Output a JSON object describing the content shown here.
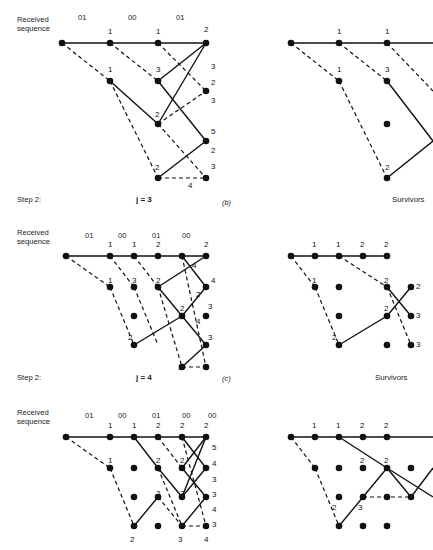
{
  "figure": {
    "caption_parts": [
      "(b)",
      "(c)"
    ],
    "received_label_line1": "Received",
    "received_label_line2": "sequence",
    "step_label": "Step 2:",
    "survivors_label": "Survivors",
    "j_label_b": "j = 3",
    "j_label_c": "j = 4",
    "panel_b_tag": "(b)",
    "panel_c_tag": "(c)",
    "ink_color": "#111111",
    "paper_color": "#ffffff"
  },
  "panels": [
    {
      "id": "panel-b",
      "tag": "(b)",
      "step": "Step 2:",
      "j": "j = 3",
      "received_sequence": [
        "01",
        "00",
        "01"
      ],
      "left_metrics": [
        {
          "value": "1",
          "x": 112,
          "y": 36
        },
        {
          "value": "1",
          "x": 160,
          "y": 36
        },
        {
          "value": "2",
          "x": 206,
          "y": 34
        },
        {
          "value": "1",
          "x": 112,
          "y": 74
        },
        {
          "value": "3",
          "x": 160,
          "y": 74
        },
        {
          "value": "3",
          "x": 212,
          "y": 66
        },
        {
          "value": "2",
          "x": 212,
          "y": 84
        },
        {
          "value": "3",
          "x": 212,
          "y": 100
        },
        {
          "value": "2",
          "x": 160,
          "y": 117
        },
        {
          "value": "5",
          "x": 212,
          "y": 134
        },
        {
          "value": "2",
          "x": 212,
          "y": 153
        },
        {
          "value": "2",
          "x": 160,
          "y": 168
        },
        {
          "value": "3",
          "x": 212,
          "y": 169
        },
        {
          "value": "4",
          "x": 190,
          "y": 188
        }
      ],
      "right_metrics": [
        {
          "value": "1",
          "x": 341,
          "y": 36
        },
        {
          "value": "1",
          "x": 389,
          "y": 36
        },
        {
          "value": "1",
          "x": 341,
          "y": 74
        },
        {
          "value": "3",
          "x": 389,
          "y": 74
        },
        {
          "value": "2",
          "x": 389,
          "y": 168
        }
      ]
    },
    {
      "id": "panel-c",
      "tag": "(c)",
      "step": "Step 2:",
      "j": "j = 4",
      "received_sequence": [
        "01",
        "00",
        "01",
        "00"
      ],
      "left_metrics": [
        {
          "value": "1",
          "x": 112,
          "y": 249
        },
        {
          "value": "1",
          "x": 160,
          "y": 249
        },
        {
          "value": "2",
          "x": 184,
          "y": 249
        },
        {
          "value": "2",
          "x": 208,
          "y": 249
        },
        {
          "value": "1",
          "x": 112,
          "y": 283
        },
        {
          "value": "3",
          "x": 150,
          "y": 283
        },
        {
          "value": "2",
          "x": 182,
          "y": 283
        },
        {
          "value": "4",
          "x": 200,
          "y": 268
        },
        {
          "value": "4",
          "x": 212,
          "y": 283
        },
        {
          "value": "2",
          "x": 205,
          "y": 297
        },
        {
          "value": "2",
          "x": 172,
          "y": 311
        },
        {
          "value": "3",
          "x": 208,
          "y": 309
        },
        {
          "value": "4",
          "x": 200,
          "y": 324
        },
        {
          "value": "2",
          "x": 130,
          "y": 340
        },
        {
          "value": "3",
          "x": 210,
          "y": 340
        },
        {
          "value": "3",
          "x": 166,
          "y": 363
        },
        {
          "value": "4",
          "x": 208,
          "y": 363
        }
      ],
      "right_metrics": [
        {
          "value": "1",
          "x": 341,
          "y": 249
        },
        {
          "value": "1",
          "x": 370,
          "y": 249
        },
        {
          "value": "2",
          "x": 398,
          "y": 249
        },
        {
          "value": "2",
          "x": 424,
          "y": 249
        },
        {
          "value": "1",
          "x": 341,
          "y": 283
        },
        {
          "value": "2",
          "x": 398,
          "y": 283
        },
        {
          "value": "2",
          "x": 428,
          "y": 290
        },
        {
          "value": "2",
          "x": 398,
          "y": 311
        },
        {
          "value": "3",
          "x": 428,
          "y": 323
        },
        {
          "value": "2",
          "x": 358,
          "y": 340
        },
        {
          "value": "3",
          "x": 428,
          "y": 355
        }
      ]
    },
    {
      "id": "panel-d",
      "tag": "",
      "step": "",
      "j": "",
      "received_sequence": [
        "01",
        "00",
        "01",
        "00",
        "00"
      ],
      "left_metrics": [
        {
          "value": "1",
          "x": 112,
          "y": 430
        },
        {
          "value": "1",
          "x": 148,
          "y": 430
        },
        {
          "value": "2",
          "x": 172,
          "y": 430
        },
        {
          "value": "2",
          "x": 194,
          "y": 430
        },
        {
          "value": "2",
          "x": 212,
          "y": 430
        },
        {
          "value": "1",
          "x": 112,
          "y": 463
        },
        {
          "value": "2",
          "x": 172,
          "y": 463
        },
        {
          "value": "2",
          "x": 196,
          "y": 463
        },
        {
          "value": "5",
          "x": 218,
          "y": 450
        },
        {
          "value": "4",
          "x": 218,
          "y": 466
        },
        {
          "value": "3",
          "x": 218,
          "y": 482
        },
        {
          "value": "2",
          "x": 172,
          "y": 498
        },
        {
          "value": "3",
          "x": 196,
          "y": 496
        },
        {
          "value": "3",
          "x": 218,
          "y": 497
        },
        {
          "value": "4",
          "x": 218,
          "y": 512
        },
        {
          "value": "3",
          "x": 218,
          "y": 527
        },
        {
          "value": "2",
          "x": 132,
          "y": 542
        },
        {
          "value": "3",
          "x": 194,
          "y": 542
        },
        {
          "value": "4",
          "x": 215,
          "y": 542
        }
      ],
      "right_metrics": [
        {
          "value": "1",
          "x": 341,
          "y": 430
        },
        {
          "value": "1",
          "x": 370,
          "y": 430
        },
        {
          "value": "2",
          "x": 398,
          "y": 430
        },
        {
          "value": "2",
          "x": 422,
          "y": 430
        },
        {
          "value": "2",
          "x": 398,
          "y": 463
        },
        {
          "value": "2",
          "x": 424,
          "y": 463
        },
        {
          "value": "2",
          "x": 392,
          "y": 500
        },
        {
          "value": "3",
          "x": 418,
          "y": 500
        }
      ]
    }
  ]
}
